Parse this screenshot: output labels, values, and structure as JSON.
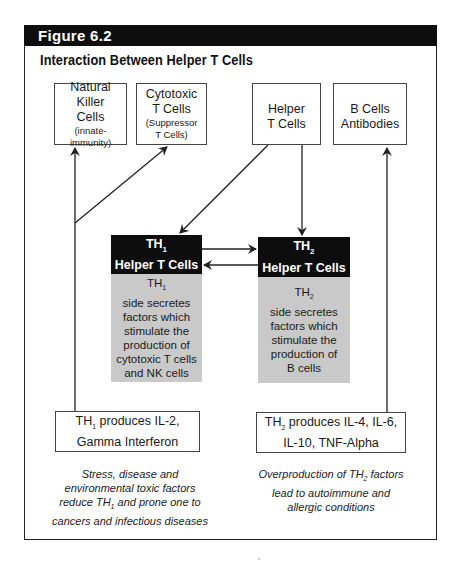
{
  "figure": {
    "label": "Figure 6.2",
    "title": "Interaction Between Helper T Cells"
  },
  "top_boxes": [
    {
      "id": "nk",
      "line1": "Natural Killer",
      "line2": "Cells",
      "note": "(innate-immunity)"
    },
    {
      "id": "cytotoxic",
      "line1": "Cytotoxic",
      "line2": "T Cells",
      "note1": "(Suppressor",
      "note2": "T Cells)"
    },
    {
      "id": "helper",
      "line1": "Helper",
      "line2": "T Cells"
    },
    {
      "id": "bcells",
      "line1": "B Cells",
      "line2": "Antibodies"
    }
  ],
  "th1": {
    "name_main": "TH",
    "name_sub": "1",
    "label": "Helper T Cells",
    "desc_head_main": "TH",
    "desc_head_sub": "1",
    "desc_lines": [
      "side secretes",
      "factors which",
      "stimulate the",
      "production of",
      "cytotoxic T cells",
      "and NK cells"
    ]
  },
  "th2": {
    "name_main": "TH",
    "name_sub": "2",
    "label": "Helper T Cells",
    "desc_head_main": "TH",
    "desc_head_sub": "2",
    "desc_lines": [
      "side secretes",
      "factors which",
      "stimulate the",
      "production of",
      "B cells"
    ]
  },
  "bottom_boxes": {
    "th1": {
      "prefix": "TH",
      "sub": "1",
      "line1_rest": " produces IL-2,",
      "line2": "Gamma Interferon"
    },
    "th2": {
      "prefix": "TH",
      "sub": "2",
      "line1_rest": " produces IL-4, IL-6,",
      "line2": "IL-10, TNF-Alpha"
    }
  },
  "captions": {
    "left": {
      "line1": "Stress, disease and",
      "line2": "environmental toxic factors",
      "line3_pre": "reduce TH",
      "line3_sub": "1",
      "line3_post": " and prone one to",
      "line4": "cancers and infectious diseases"
    },
    "right": {
      "line1_pre": "Overproduction of TH",
      "line1_sub": "2",
      "line1_post": " factors",
      "line2": "lead to autoimmune and",
      "line3": "allergic conditions"
    }
  },
  "colors": {
    "dark_box": "#0d0d0d",
    "gray_box": "#c9c9c9",
    "line": "#222222"
  }
}
